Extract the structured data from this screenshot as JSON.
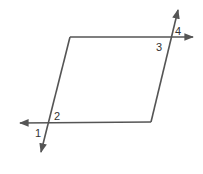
{
  "diagram": {
    "type": "parallelogram-with-transversals",
    "stroke_color": "#555555",
    "background": "#ffffff",
    "angle_labels": [
      {
        "id": "1",
        "text": "1",
        "x": 35,
        "y": 137
      },
      {
        "id": "2",
        "text": "2",
        "x": 54,
        "y": 120
      },
      {
        "id": "3",
        "text": "3",
        "x": 156,
        "y": 51
      },
      {
        "id": "4",
        "text": "4",
        "x": 175,
        "y": 35
      }
    ]
  }
}
